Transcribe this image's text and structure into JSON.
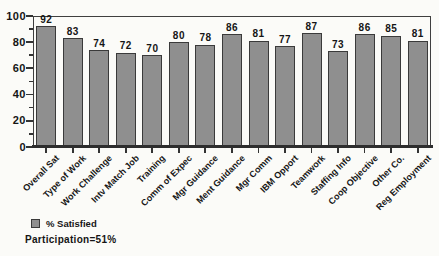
{
  "chart_data": {
    "type": "bar",
    "title": "",
    "xlabel": "",
    "ylabel": "",
    "categories": [
      "Overall Sat",
      "Type of Work",
      "Work Challenge",
      "Intv Match Job",
      "Training",
      "Comm of Expec",
      "Mgr Guidance",
      "Ment Guidance",
      "Mgr Comm",
      "IBM Opport",
      "Teamwork",
      "Staffing Info",
      "Coop Objective",
      "Other Co.",
      "Reg Employment"
    ],
    "values": [
      92,
      83,
      74,
      72,
      70,
      80,
      78,
      86,
      81,
      77,
      87,
      73,
      86,
      85,
      81
    ],
    "ylim": [
      0,
      100
    ],
    "yticks_major": [
      0,
      20,
      40,
      60,
      80,
      100
    ],
    "yticks_minor": [
      10,
      30,
      50,
      70,
      90
    ],
    "grid": false,
    "legend_position": "bottom-left",
    "legend_label": "% Satisfied",
    "note": "Participation=51%",
    "bar_color": "#8f8f8f",
    "bar_border_color": "#3a3a3a",
    "axis_color": "#333333",
    "text_color": "#151515"
  }
}
